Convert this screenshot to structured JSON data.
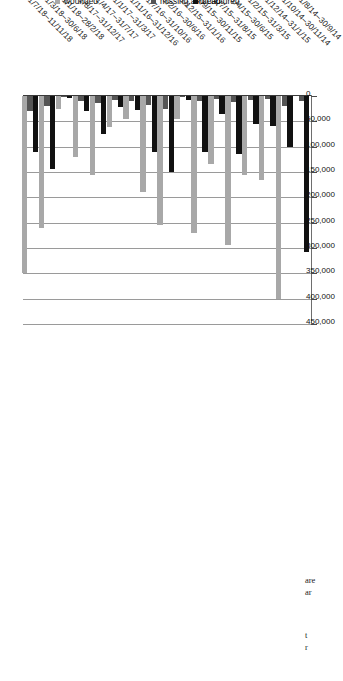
{
  "chart_data": {
    "type": "bar",
    "orientation": "horizontal",
    "title": "",
    "xlabel": "",
    "ylabel": "",
    "xlim": [
      0,
      450000
    ],
    "grid": true,
    "legend_position": "left",
    "tick_labels": [
      "0",
      "50,000",
      "100,000",
      "150,000",
      "200,000",
      "250,000",
      "300,000",
      "350,000",
      "400,000",
      "450,000"
    ],
    "tick_values": [
      0,
      50000,
      100000,
      150000,
      200000,
      250000,
      300000,
      350000,
      400000,
      450000
    ],
    "categories": [
      "1/8/14–30/9/14",
      "1/10/14–30/11/14",
      "1/12/14–31/1/15",
      "1/2/15–31/3/15",
      "1/4/15–30/6/15",
      "1/7/15–31/8/15",
      "1/9/15–30/11/15",
      "1/12/15–31/1/16",
      "1/2/16–30/6/16",
      "1/7/16–31/10/16",
      "1/11/16–31/12/16",
      "1/1/17–31/3/17",
      "1/4/17–31/7/17",
      "1/8/17–31/12/17",
      "1/1/18–28/2/18",
      "1/3/18–30/6/18",
      "1/7/18–11/11/18"
    ],
    "series": [
      {
        "name": "dead",
        "color": "#111111",
        "values": [
          307000,
          100000,
          60000,
          55000,
          115000,
          35000,
          110000,
          8000,
          150000,
          110000,
          28000,
          22000,
          75000,
          30000,
          3000,
          145000,
          110000
        ]
      },
      {
        "name": "missing and captured",
        "color": "#555555",
        "values": [
          10000,
          20000,
          6000,
          8000,
          12000,
          5000,
          9000,
          2000,
          25000,
          18000,
          9000,
          7000,
          14000,
          9000,
          1500,
          20000,
          30000
        ]
      },
      {
        "name": "wounded",
        "color": "#a8a8a8",
        "values": [
          0,
          400000,
          165000,
          155000,
          295000,
          135000,
          270000,
          45000,
          255000,
          190000,
          45000,
          62000,
          155000,
          120000,
          25000,
          260000,
          350000
        ]
      }
    ]
  },
  "legend": {
    "items": [
      {
        "label": "dead",
        "swatch": "sw-dead"
      },
      {
        "label": "missing and captured",
        "swatch": "sw-missing"
      },
      {
        "label": "wounded",
        "swatch": "sw-wounded"
      }
    ]
  },
  "caption_fragments": [
    {
      "text": "are"
    },
    {
      "text": "ar"
    },
    {
      "text": "t"
    },
    {
      "text": "r"
    }
  ]
}
